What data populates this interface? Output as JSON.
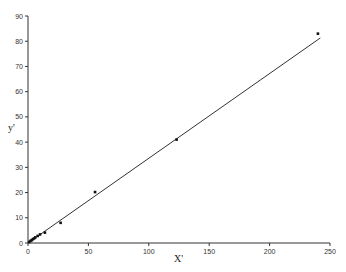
{
  "chart_data": {
    "type": "scatter",
    "title": "",
    "xlabel": "X'",
    "ylabel": "y'",
    "xlim": [
      0,
      250
    ],
    "ylim": [
      0,
      90
    ],
    "x_ticks": [
      0,
      50,
      100,
      150,
      200,
      250
    ],
    "y_ticks": [
      0,
      10,
      20,
      30,
      40,
      50,
      60,
      70,
      80,
      90
    ],
    "grid": false,
    "legend": null,
    "series": [
      {
        "name": "data",
        "kind": "points",
        "x": [
          1,
          2,
          3,
          4,
          5,
          6,
          8,
          10,
          14,
          27,
          55.5,
          123,
          240
        ],
        "y": [
          0.4,
          0.8,
          1.1,
          1.5,
          1.8,
          2.2,
          2.8,
          3.4,
          4.1,
          8,
          20.2,
          41,
          83
        ]
      },
      {
        "name": "fit",
        "kind": "line",
        "x": [
          0,
          242
        ],
        "y": [
          0,
          81.3
        ]
      }
    ]
  },
  "axes": {
    "x_label": "X'",
    "y_label": "y'",
    "x_tick_labels": [
      "0",
      "50",
      "100",
      "150",
      "200",
      "250"
    ],
    "y_tick_labels": [
      "0",
      "10",
      "20",
      "30",
      "40",
      "50",
      "60",
      "70",
      "80",
      "90"
    ]
  }
}
